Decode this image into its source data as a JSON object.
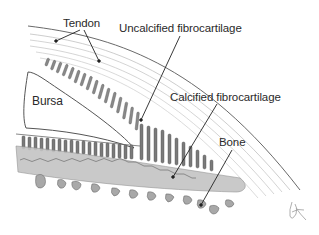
{
  "figure": {
    "labels": {
      "tendon": "Tendon",
      "uncalcified": "Uncalcified fibrocartilage",
      "bursa": "Bursa",
      "calcified": "Calcified fibrocartilage",
      "bone": "Bone"
    },
    "signature": "JK"
  },
  "colors": {
    "background": "#ffffff",
    "ink": "#3a3a3a",
    "fibers": "#8a8a8a",
    "fibrocartilage_cells": "#6e6e6e",
    "calcified_zone": "#bdbdbd",
    "bone_fragments": "#a9a9a9"
  }
}
